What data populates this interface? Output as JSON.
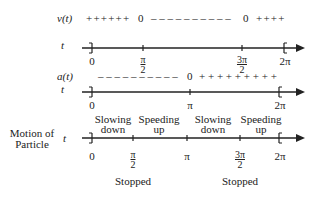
{
  "velocity_row": {
    "label": "v(t)",
    "axis_var": "t",
    "signs_positive_1": "++++++",
    "zero_1": "0",
    "signs_negative": "– – – – – – – – – –",
    "zero_2": "0",
    "signs_positive_2": "++++",
    "ticks": [
      {
        "label": "0"
      },
      {
        "num": "π",
        "den": "2"
      },
      {
        "num": "3π",
        "den": "2"
      },
      {
        "label": "2π"
      }
    ]
  },
  "acceleration_row": {
    "label": "a(t)",
    "axis_var": "t",
    "signs_negative": "– – – – – – – – – –",
    "zero": "0",
    "signs_positive": "+ + + + + + + + +",
    "ticks": [
      {
        "label": "0"
      },
      {
        "label": "π"
      },
      {
        "label": "2π"
      }
    ]
  },
  "motion_row": {
    "label_line1": "Motion of",
    "label_line2": "Particle",
    "axis_var": "t",
    "segments": [
      {
        "line1": "Slowing",
        "line2": "down"
      },
      {
        "line1": "Speeding",
        "line2": "up"
      },
      {
        "line1": "Slowing",
        "line2": "down"
      },
      {
        "line1": "Speeding",
        "line2": "up"
      }
    ],
    "ticks": [
      {
        "label": "0"
      },
      {
        "num": "π",
        "den": "2"
      },
      {
        "label": "π"
      },
      {
        "num": "3π",
        "den": "2"
      },
      {
        "label": "2π"
      }
    ],
    "stopped_1": "Stopped",
    "stopped_2": "Stopped"
  }
}
